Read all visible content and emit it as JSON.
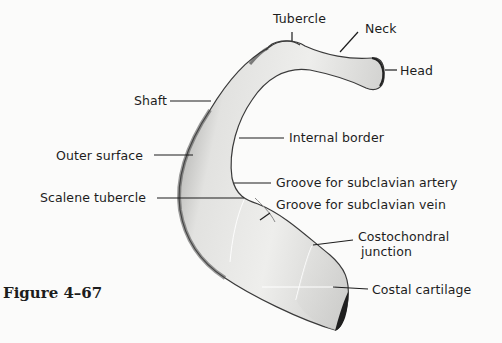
{
  "figure": {
    "caption": "Figure 4–67"
  },
  "labels": {
    "tubercle": "Tubercle",
    "neck": "Neck",
    "head": "Head",
    "shaft": "Shaft",
    "internal_border": "Internal border",
    "outer_surface": "Outer surface",
    "groove_artery": "Groove for subclavian artery",
    "scalene_tubercle": "Scalene tubercle",
    "groove_vein": "Groove for subclavian vein",
    "costochondral_line1": "Costochondral",
    "costochondral_line2": "junction",
    "costal_cartilage": "Costal cartilage"
  },
  "colors": {
    "bone_fill": "#e4e4e2",
    "bone_shadow": "#555555",
    "line": "#1d1d1d",
    "background": "#fbfbfa"
  }
}
